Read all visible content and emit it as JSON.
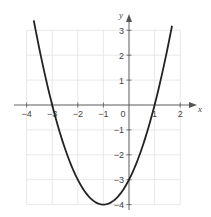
{
  "chart_data": {
    "type": "line",
    "title": "",
    "function": "y = x^2 + 2x - 3",
    "xlabel": "x",
    "ylabel": "y",
    "xlim": [
      -4,
      2
    ],
    "ylim": [
      -4,
      3
    ],
    "grid": true,
    "x_ticks": [
      -4,
      -3,
      -2,
      -1,
      0,
      1,
      2
    ],
    "y_ticks": [
      3,
      2,
      1,
      -1,
      -2,
      -3,
      -4
    ],
    "x_tick_labels": [
      "−4",
      "−3",
      "−2",
      "−1",
      "0",
      "1",
      "2"
    ],
    "y_tick_labels": [
      "3",
      "2",
      "1",
      "−1",
      "−2",
      "−3",
      "−4"
    ],
    "series": [
      {
        "name": "parabola",
        "x": [
          -3.7,
          -3.5,
          -3,
          -2.5,
          -2,
          -1.5,
          -1,
          -0.5,
          0,
          0.5,
          1,
          1.5,
          1.7
        ],
        "values": [
          3.29,
          2.25,
          0,
          -1.75,
          -3,
          -3.75,
          -4,
          -3.75,
          -3,
          -1.75,
          0,
          2.25,
          3.29
        ]
      }
    ],
    "key_points": {
      "vertex": [
        -1,
        -4
      ],
      "roots": [
        -3,
        1
      ],
      "y_intercept": -3
    },
    "colors": {
      "curve": "#222222",
      "axes": "#555555",
      "grid": "#e2e2e2"
    }
  }
}
